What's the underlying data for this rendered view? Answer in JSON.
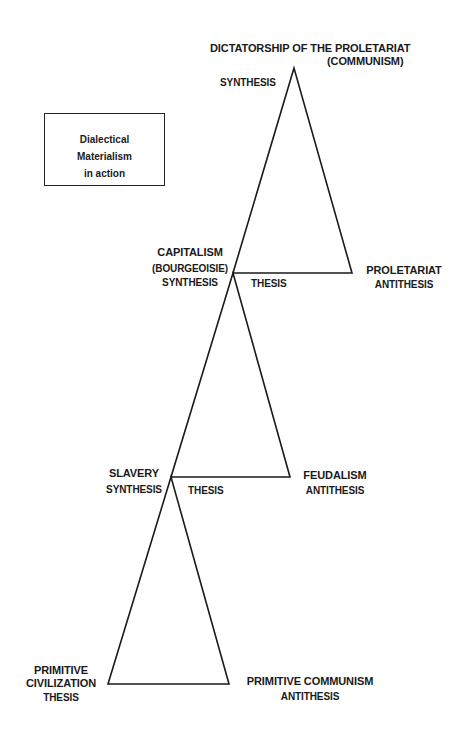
{
  "legend_box": {
    "line1": "Dialectical",
    "line2": "Materialism",
    "line3": "in action"
  },
  "top": {
    "title_line1": "DICTATORSHIP OF THE PROLETARIAT",
    "title_line2": "(COMMUNISM)",
    "role": "SYNTHESIS"
  },
  "stage3": {
    "thesis_name1": "CAPITALISM",
    "thesis_name2": "(BOURGEOISIE)",
    "thesis_role_left": "SYNTHESIS",
    "thesis_role": "THESIS",
    "antithesis_name": "PROLETARIAT",
    "antithesis_role": "ANTITHESIS"
  },
  "stage2": {
    "thesis_name": "SLAVERY",
    "thesis_role_left": "SYNTHESIS",
    "thesis_role": "THESIS",
    "antithesis_name": "FEUDALISM",
    "antithesis_role": "ANTITHESIS"
  },
  "stage1": {
    "thesis_name1": "PRIMITIVE",
    "thesis_name2": "CIVILIZATION",
    "thesis_role": "THESIS",
    "antithesis_name": "PRIMITIVE COMMUNISM",
    "antithesis_role": "ANTITHESIS"
  },
  "colors": {
    "line": "#1a1a1a",
    "background": "#ffffff"
  }
}
